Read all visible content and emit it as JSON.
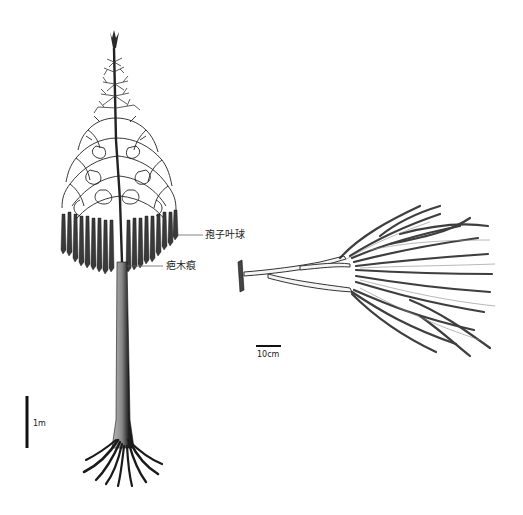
{
  "figure": {
    "labels": {
      "strobilus": "孢子叶球",
      "leaf_scar": "疤木痕"
    },
    "scale_bars": {
      "tree": "1m",
      "branch": "10cm"
    },
    "colors": {
      "ink": "#1a1a1a",
      "shade": "#555555",
      "background": "#ffffff",
      "leader_line": "#666666"
    }
  }
}
